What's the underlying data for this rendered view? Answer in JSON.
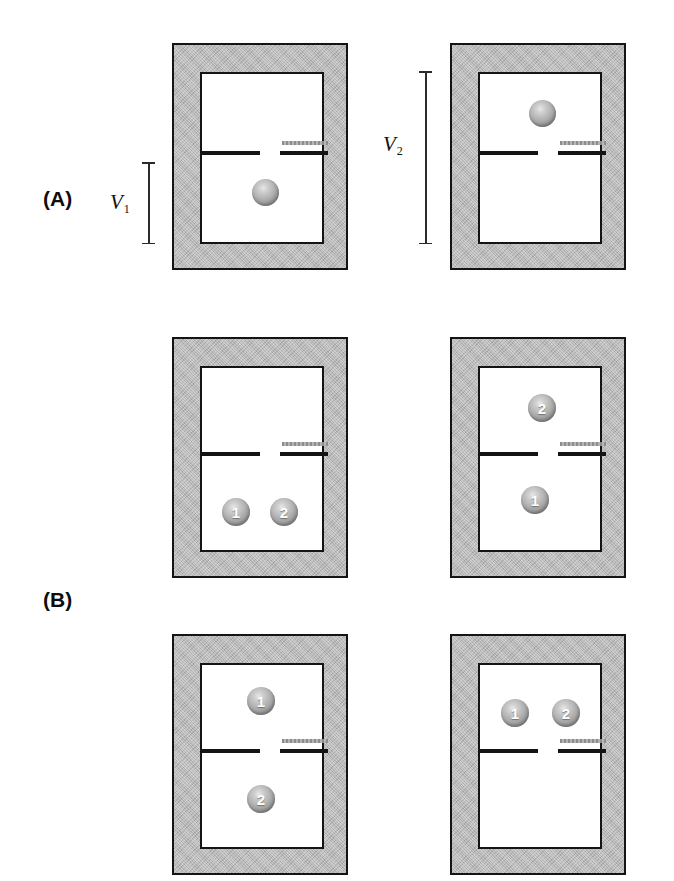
{
  "figure": {
    "background_color": "#ffffff",
    "wall_color": "#b9b9b9",
    "outline_color": "#141414",
    "particle_color": "#ababab",
    "partition_color": "#141414",
    "slider_color": "#9a9a9a"
  },
  "panels": [
    {
      "id": "A",
      "label": "(A)"
    },
    {
      "id": "B",
      "label": "(B)"
    }
  ],
  "measures": [
    {
      "id": "v1",
      "label": "V",
      "subscript": "1",
      "description": "height of lower compartment only"
    },
    {
      "id": "v2",
      "label": "V",
      "subscript": "2",
      "description": "full interior height of vessel"
    }
  ],
  "boxes": [
    {
      "id": "a-left",
      "panel": "A",
      "row": 1,
      "column": "left",
      "partition": "closed-left-open-right",
      "particles": [
        {
          "label": "",
          "compartment": "lower",
          "x_pct": 50,
          "y_pct": 66
        }
      ]
    },
    {
      "id": "a-right",
      "panel": "A",
      "row": 1,
      "column": "right",
      "partition": "closed-left-open-right",
      "particles": [
        {
          "label": "",
          "compartment": "upper",
          "x_pct": 50,
          "y_pct": 19
        }
      ]
    },
    {
      "id": "b-row1-left",
      "panel": "B",
      "row": 2,
      "column": "left",
      "partition": "closed-left-open-right",
      "particles": [
        {
          "label": "1",
          "compartment": "lower",
          "x_pct": 25,
          "y_pct": 77
        },
        {
          "label": "2",
          "compartment": "lower",
          "x_pct": 62,
          "y_pct": 77
        }
      ]
    },
    {
      "id": "b-row1-right",
      "panel": "B",
      "row": 2,
      "column": "right",
      "partition": "closed-left-open-right",
      "particles": [
        {
          "label": "2",
          "compartment": "upper",
          "x_pct": 47,
          "y_pct": 21
        },
        {
          "label": "1",
          "compartment": "lower",
          "x_pct": 40,
          "y_pct": 71
        }
      ]
    },
    {
      "id": "b-row2-left",
      "panel": "B",
      "row": 3,
      "column": "left",
      "partition": "closed-left-open-right",
      "particles": [
        {
          "label": "1",
          "compartment": "upper",
          "x_pct": 45,
          "y_pct": 19
        },
        {
          "label": "2",
          "compartment": "lower",
          "x_pct": 45,
          "y_pct": 72
        }
      ]
    },
    {
      "id": "b-row2-right",
      "panel": "B",
      "row": 3,
      "column": "right",
      "partition": "closed-left-open-right",
      "particles": [
        {
          "label": "1",
          "compartment": "upper",
          "x_pct": 27,
          "y_pct": 26
        },
        {
          "label": "2",
          "compartment": "upper",
          "x_pct": 68,
          "y_pct": 26
        }
      ]
    }
  ]
}
